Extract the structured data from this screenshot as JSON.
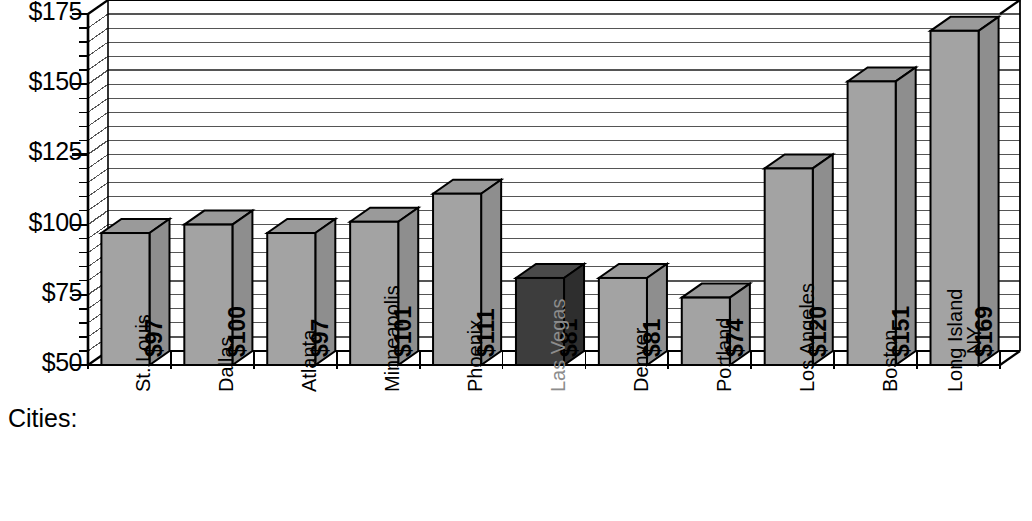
{
  "chart_data": {
    "type": "bar",
    "title": "Average Monthly Energy Bill",
    "xlabel": "Cities:",
    "ylabel": "",
    "ylim": [
      50,
      175
    ],
    "ytick_step": 25,
    "gridline_step": 5,
    "grid": true,
    "legend": "none",
    "y_tick_labels": [
      "$175",
      "$150",
      "$125",
      "$100",
      "$75",
      "$50"
    ],
    "y_tick_values": [
      175,
      150,
      125,
      100,
      75,
      50
    ],
    "categories": [
      "St. Louis",
      "Dallas",
      "Atlanta",
      "Minneapolis",
      "Phoenix",
      "Las Vegas",
      "Denver",
      "Portland",
      "Los Angeles",
      "Boston",
      "Long Island NY"
    ],
    "category_lines": [
      [
        "St. Louis"
      ],
      [
        "Dallas"
      ],
      [
        "Atlanta"
      ],
      [
        "Minneapolis"
      ],
      [
        "Phoenix"
      ],
      [
        "Las Vegas"
      ],
      [
        "Denver"
      ],
      [
        "Portland"
      ],
      [
        "Los Angeles"
      ],
      [
        "Boston"
      ],
      [
        "Long Island",
        "NY"
      ]
    ],
    "values": [
      97,
      100,
      97,
      101,
      111,
      81,
      81,
      74,
      120,
      151,
      169
    ],
    "value_labels": [
      "$97",
      "$100",
      "$97",
      "$101",
      "$111",
      "$81",
      "$81",
      "$74",
      "$120",
      "$151",
      "$169"
    ],
    "highlight_index": 5,
    "highlight_category": "Las Vegas"
  },
  "colors": {
    "bar_front": "#a3a3a3",
    "bar_top": "#9a9a9a",
    "bar_side": "#8e8e8e",
    "bar_front_highlight": "#3d3d3d",
    "bar_top_highlight": "#4a4a4a",
    "bar_side_highlight": "#2e2e2e",
    "axis": "#000000",
    "gridline": "#555555",
    "background": "#ffffff",
    "muted_label": "#8c8c8c"
  }
}
